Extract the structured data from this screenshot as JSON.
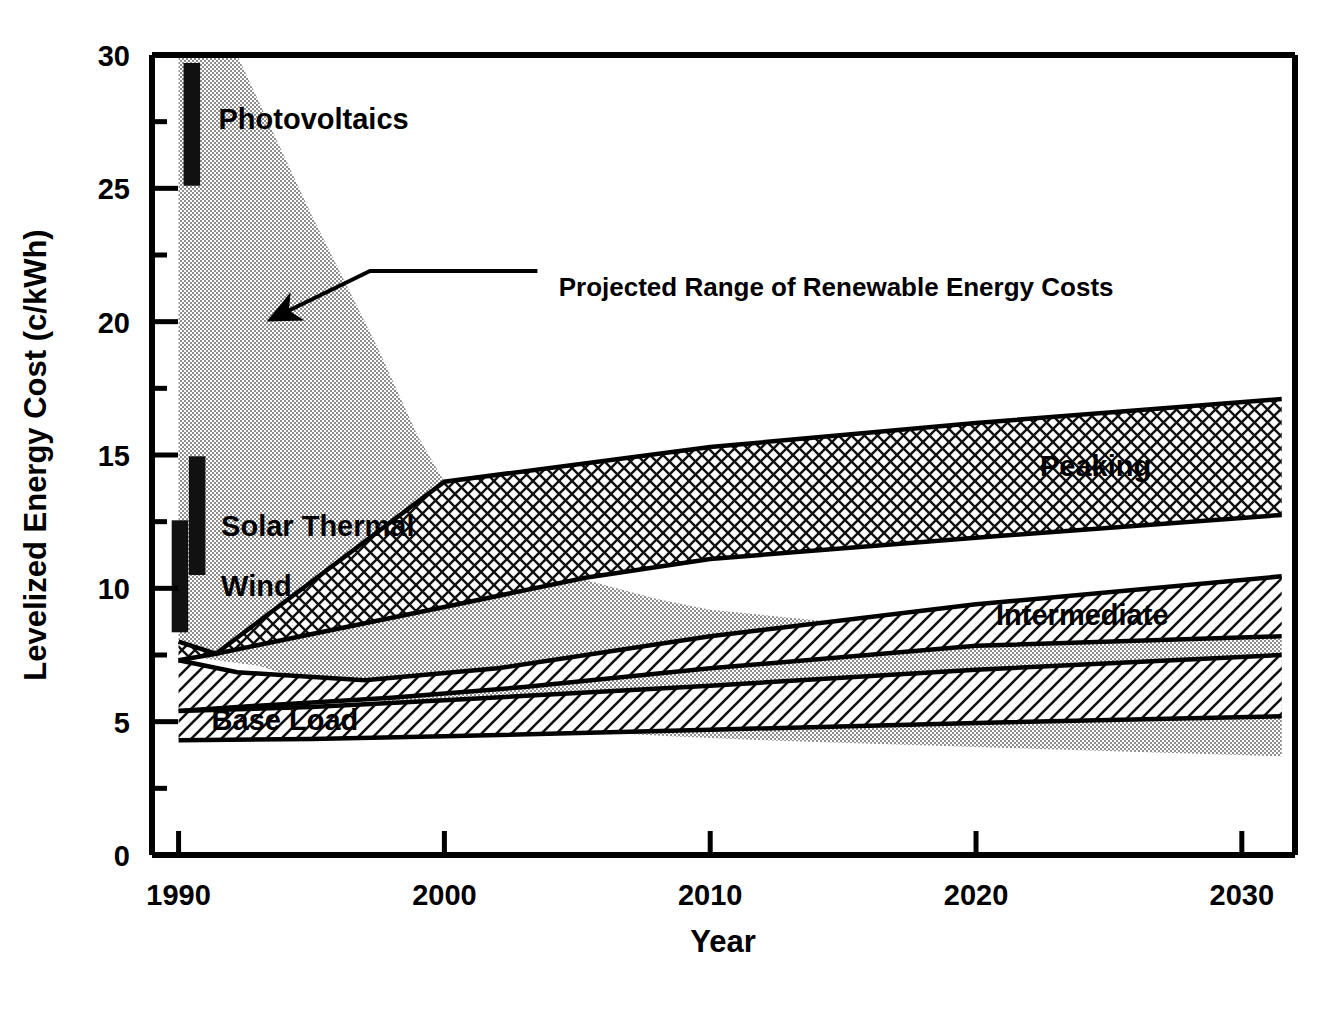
{
  "chart_data": {
    "type": "area",
    "title": "",
    "xlabel": "Year",
    "ylabel": "Levelized Energy Cost (c/kWh)",
    "xlim": [
      1989,
      2032
    ],
    "ylim": [
      0,
      30
    ],
    "xticks": [
      1990,
      2000,
      2010,
      2020,
      2030
    ],
    "xtick_labels": [
      "1990",
      "2000",
      "2010",
      "2020",
      "2030"
    ],
    "yticks": [
      0,
      5,
      10,
      15,
      20,
      25,
      30
    ],
    "ytick_labels": [
      "0",
      "5",
      "10",
      "15",
      "20",
      "25",
      "30"
    ],
    "yminor_ticks": [
      2.5,
      7.5,
      12.5,
      17.5,
      22.5,
      27.5
    ],
    "grid": false,
    "legend_position": "inline-labels",
    "annotations": [
      {
        "name": "renewable-range-callout",
        "text": "Projected Range of Renewable Energy Costs",
        "text_x": 2004.3,
        "text_y": 21.3,
        "arrow_tip_x": 1993.5,
        "arrow_tip_y": 20.1,
        "arrow_bend_x": 1997.2,
        "arrow_bend_y": 21.9,
        "arrow_tail_x": 2003.5,
        "arrow_tail_y": 21.9
      }
    ],
    "bands": [
      {
        "name": "renewable-range",
        "label": "Projected Range of Renewable Energy Costs",
        "fill": "stipple",
        "color": "#9a9a9a",
        "outline": false,
        "upper": [
          {
            "x": 1990.0,
            "y": 30.0
          },
          {
            "x": 1992.2,
            "y": 30.0
          },
          {
            "x": 1995.0,
            "y": 24.0
          },
          {
            "x": 1997.5,
            "y": 19.0
          },
          {
            "x": 1999.0,
            "y": 15.7
          },
          {
            "x": 2000.0,
            "y": 14.0
          },
          {
            "x": 2002.5,
            "y": 12.1
          },
          {
            "x": 2005.0,
            "y": 10.4
          },
          {
            "x": 2008.0,
            "y": 9.6
          },
          {
            "x": 2010.0,
            "y": 9.2
          },
          {
            "x": 2015.0,
            "y": 8.7
          },
          {
            "x": 2020.0,
            "y": 8.4
          },
          {
            "x": 2025.0,
            "y": 8.2
          },
          {
            "x": 2031.5,
            "y": 8.1
          }
        ],
        "lower": [
          {
            "x": 1990.0,
            "y": 7.5
          },
          {
            "x": 1993.0,
            "y": 7.1
          },
          {
            "x": 1996.0,
            "y": 6.2
          },
          {
            "x": 2000.0,
            "y": 5.2
          },
          {
            "x": 2004.0,
            "y": 4.7
          },
          {
            "x": 2008.5,
            "y": 4.45
          },
          {
            "x": 2012.0,
            "y": 4.3
          },
          {
            "x": 2020.0,
            "y": 4.05
          },
          {
            "x": 2031.5,
            "y": 3.7
          }
        ]
      },
      {
        "name": "peaking-band",
        "label": "Peaking",
        "fill": "crosshatch",
        "color": "#000000",
        "outline": true,
        "label_x": 2024.5,
        "label_y": 14.6,
        "upper": [
          {
            "x": 1990.0,
            "y": 8.0
          },
          {
            "x": 1991.4,
            "y": 7.55
          },
          {
            "x": 2000.0,
            "y": 14.0
          },
          {
            "x": 2010.0,
            "y": 15.3
          },
          {
            "x": 2020.0,
            "y": 16.2
          },
          {
            "x": 2031.5,
            "y": 17.1
          }
        ],
        "lower": [
          {
            "x": 1990.0,
            "y": 7.3
          },
          {
            "x": 1991.4,
            "y": 7.55
          },
          {
            "x": 2000.0,
            "y": 9.3
          },
          {
            "x": 2005.3,
            "y": 10.4
          },
          {
            "x": 2010.0,
            "y": 11.1
          },
          {
            "x": 2020.0,
            "y": 11.9
          },
          {
            "x": 2031.5,
            "y": 12.75
          }
        ]
      },
      {
        "name": "intermediate-band",
        "label": "Intermediate",
        "fill": "hatch-up",
        "color": "#000000",
        "outline": true,
        "label_x": 2024.0,
        "label_y": 9.0,
        "upper": [
          {
            "x": 1990.0,
            "y": 7.3
          },
          {
            "x": 1992.2,
            "y": 6.85
          },
          {
            "x": 1997.0,
            "y": 6.55
          },
          {
            "x": 2002.0,
            "y": 7.0
          },
          {
            "x": 2010.0,
            "y": 8.2
          },
          {
            "x": 2020.0,
            "y": 9.4
          },
          {
            "x": 2031.5,
            "y": 10.45
          }
        ],
        "lower": [
          {
            "x": 1990.0,
            "y": 5.4
          },
          {
            "x": 1993.0,
            "y": 5.6
          },
          {
            "x": 1998.0,
            "y": 5.9
          },
          {
            "x": 2003.0,
            "y": 6.3
          },
          {
            "x": 2010.0,
            "y": 7.0
          },
          {
            "x": 2020.0,
            "y": 7.85
          },
          {
            "x": 2031.5,
            "y": 8.2
          }
        ]
      },
      {
        "name": "base-load-band",
        "label": "Base Load",
        "fill": "hatch-up",
        "color": "#000000",
        "outline": true,
        "label_x": 1994.0,
        "label_y": 5.05,
        "upper": [
          {
            "x": 1990.0,
            "y": 5.4
          },
          {
            "x": 1995.0,
            "y": 5.55
          },
          {
            "x": 2000.0,
            "y": 5.8
          },
          {
            "x": 2010.0,
            "y": 6.35
          },
          {
            "x": 2020.0,
            "y": 6.95
          },
          {
            "x": 2031.5,
            "y": 7.5
          }
        ],
        "lower": [
          {
            "x": 1990.0,
            "y": 4.3
          },
          {
            "x": 1995.0,
            "y": 4.35
          },
          {
            "x": 2000.0,
            "y": 4.45
          },
          {
            "x": 2010.0,
            "y": 4.7
          },
          {
            "x": 2020.0,
            "y": 4.95
          },
          {
            "x": 2031.5,
            "y": 5.2
          }
        ]
      }
    ],
    "range_bars": [
      {
        "name": "photovoltaics-bar",
        "label": "Photovoltaics",
        "x": 1990.5,
        "low": 25.1,
        "high": 29.7,
        "width_years": 0.62,
        "label_x": 1991.5,
        "label_y": 27.6
      },
      {
        "name": "solar-thermal-bar",
        "label": "Solar Thermal",
        "x": 1990.7,
        "low": 10.5,
        "high": 14.95,
        "width_years": 0.62,
        "label_x": 1991.6,
        "label_y": 12.35
      },
      {
        "name": "wind-bar",
        "label": "Wind",
        "x": 1990.05,
        "low": 8.35,
        "high": 12.55,
        "width_years": 0.62,
        "label_x": 1991.6,
        "label_y": 10.1
      }
    ]
  },
  "axes": {
    "y_title": "Levelized Energy Cost (c/kWh)",
    "x_title": "Year"
  }
}
